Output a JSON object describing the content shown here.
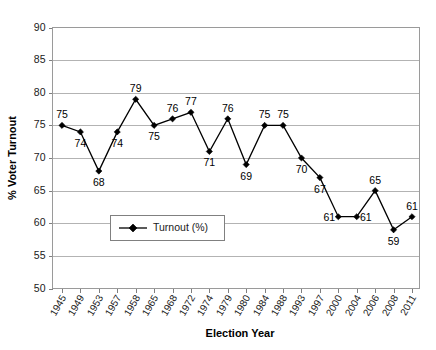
{
  "chart_data": {
    "type": "line",
    "title": "",
    "xlabel": "Election Year",
    "ylabel": "% Voter Turnout",
    "ylim": [
      50,
      90
    ],
    "ytick_step": 5,
    "yticks": [
      50,
      55,
      60,
      65,
      70,
      75,
      80,
      85,
      90
    ],
    "grid": true,
    "grid_axis": "y",
    "legend_position": "inside-lower-left",
    "categories": [
      "1945",
      "1949",
      "1953",
      "1957",
      "1958",
      "1965",
      "1968",
      "1972",
      "1974",
      "1979",
      "1980",
      "1984",
      "1988",
      "1993",
      "1997",
      "2000",
      "2004",
      "2006",
      "2008",
      "2011"
    ],
    "series": [
      {
        "name": "Turnout (%)",
        "marker": "diamond",
        "color": "#000000",
        "values": [
          75,
          74,
          68,
          74,
          79,
          75,
          76,
          77,
          71,
          76,
          69,
          75,
          75,
          70,
          67,
          61,
          61,
          65,
          59,
          61
        ],
        "data_labels": [
          "75",
          "74",
          "68",
          "74",
          "79",
          "75",
          "76",
          "77",
          "71",
          "76",
          "69",
          "75",
          "75",
          "70",
          "67",
          "61",
          "61",
          "65",
          "59",
          "61"
        ],
        "label_positions": [
          "above",
          "below",
          "below",
          "below",
          "above",
          "below",
          "above",
          "above",
          "below",
          "above",
          "below",
          "above",
          "above",
          "below",
          "below",
          "left",
          "right",
          "above",
          "below",
          "above"
        ]
      }
    ]
  },
  "legend": {
    "entries": [
      {
        "label": "Turnout (%)"
      }
    ]
  },
  "axes": {
    "y_title": "% Voter Turnout",
    "x_title": "Election Year"
  }
}
